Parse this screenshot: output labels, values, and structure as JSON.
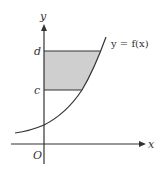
{
  "diagram": {
    "axes": {
      "x_label": "x",
      "y_label": "y",
      "origin_label": "O"
    },
    "levels": {
      "upper": "d",
      "lower": "c"
    },
    "curve_label": "y = f(x)",
    "colors": {
      "shade": "#cfcfcf",
      "line": "#333333"
    }
  }
}
